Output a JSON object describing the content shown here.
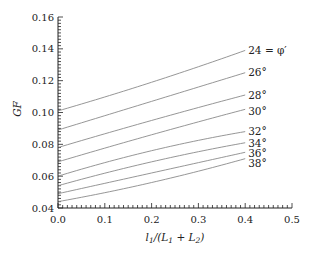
{
  "chart_data": {
    "type": "line",
    "title": "",
    "xlabel": "l1/(L1 + L2)",
    "ylabel": "GF",
    "xlim": [
      0.0,
      0.5
    ],
    "ylim": [
      0.04,
      0.16
    ],
    "grid": false,
    "legend_position": "inline-right",
    "x_ticks": [
      "0.0",
      "0.1",
      "0.2",
      "0.3",
      "0.4",
      "0.5"
    ],
    "y_ticks": [
      "0.04",
      "0.06",
      "0.08",
      "0.10",
      "0.12",
      "0.14",
      "0.16"
    ],
    "x": [
      0.0,
      0.2,
      0.4
    ],
    "series": [
      {
        "name": "24 = φ′",
        "values": [
          0.101,
          0.119,
          0.139
        ]
      },
      {
        "name": "26°",
        "values": [
          0.089,
          0.107,
          0.125
        ]
      },
      {
        "name": "28°",
        "values": [
          0.078,
          0.095,
          0.111
        ]
      },
      {
        "name": "30°",
        "values": [
          0.069,
          0.086,
          0.102
        ]
      },
      {
        "name": "32°",
        "values": [
          0.06,
          0.076,
          0.088
        ]
      },
      {
        "name": "34°",
        "values": [
          0.054,
          0.069,
          0.081
        ]
      },
      {
        "name": "36°",
        "values": [
          0.049,
          0.062,
          0.075
        ]
      },
      {
        "name": "38°",
        "values": [
          0.044,
          0.056,
          0.071
        ]
      }
    ]
  },
  "axes": {
    "xlabel_parts": {
      "l": "l",
      "sub1": "1",
      "mid": "/(L",
      "sub2": "1",
      "plus": " + L",
      "sub3": "2",
      "close": ")"
    },
    "ylabel": "GF"
  }
}
